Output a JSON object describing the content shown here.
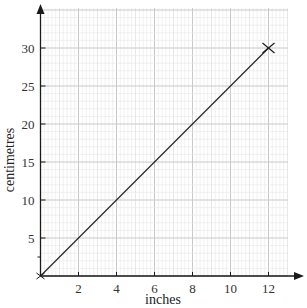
{
  "chart_data": {
    "type": "line",
    "title": "",
    "xlabel": "inches",
    "ylabel": "centimetres",
    "xlim": [
      0,
      13
    ],
    "ylim": [
      0,
      35
    ],
    "x_ticks": [
      2,
      4,
      6,
      8,
      10,
      12
    ],
    "y_ticks": [
      5,
      10,
      15,
      20,
      25,
      30
    ],
    "grid": true,
    "legend": null,
    "series": [
      {
        "name": "inches to centimetres",
        "x": [
          0,
          12
        ],
        "y": [
          0,
          30
        ],
        "marker_end": "cross"
      }
    ],
    "annotations": [
      {
        "type": "cross-marker",
        "x": 12,
        "y": 30
      }
    ]
  },
  "colors": {
    "axis": "#1a1a1a",
    "line": "#2a2a2a",
    "grid_major": "#c8c8c8",
    "grid_minor": "#e6e6e6",
    "text": "#333333"
  }
}
